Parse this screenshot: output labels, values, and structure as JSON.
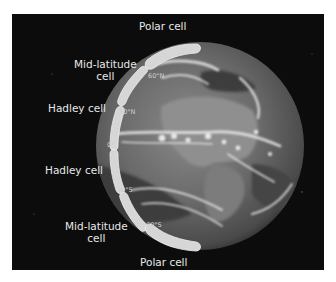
{
  "diagram": {
    "background_color": "#0c0c0c",
    "cell_color": "#d9d9d9",
    "labels": {
      "polar_north": "Polar cell",
      "midlat_north_line1": "Mid-latitude",
      "midlat_north_line2": "cell",
      "hadley_north": "Hadley cell",
      "hadley_south": "Hadley cell",
      "midlat_south_line1": "Mid-latitude",
      "midlat_south_line2": "cell",
      "polar_south": "Polar cell"
    },
    "latitudes": {
      "n60": "60°N",
      "n30": "30°N",
      "equator": "0°",
      "s30": "30°S",
      "s60": "60°S"
    }
  }
}
